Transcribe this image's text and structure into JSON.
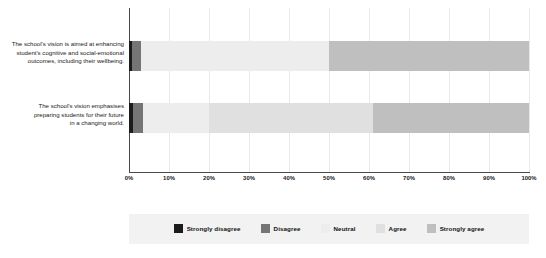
{
  "chart_data": {
    "type": "bar",
    "orientation": "horizontal",
    "stacked": true,
    "stack_mode": "percent",
    "title": "",
    "xlabel": "",
    "ylabel": "",
    "xlim": [
      0,
      100
    ],
    "grid": true,
    "legend_position": "bottom",
    "categories": [
      "The school's vision is aimed at enhancing student's cognitive and social-emotional outcomes, including their wellbeing.",
      "The school's vision emphasises preparing students for their future in a changing world."
    ],
    "category_lines": [
      [
        "The school's vision is aimed at enhancing",
        "student's cognitive and social-emotional",
        "outcomes, including their wellbeing."
      ],
      [
        "The school's vision emphasises",
        "preparing students for their future",
        "in a changing world."
      ]
    ],
    "tick_labels": [
      "0%",
      "10%",
      "20%",
      "30%",
      "40%",
      "50%",
      "60%",
      "70%",
      "80%",
      "90%",
      "100%"
    ],
    "tick_values": [
      0,
      10,
      20,
      30,
      40,
      50,
      60,
      70,
      80,
      90,
      100
    ],
    "series": [
      {
        "name": "Strongly disagree",
        "color": "#1c1c1c",
        "values": [
          0.8,
          1.0
        ]
      },
      {
        "name": "Disagree",
        "color": "#757575",
        "values": [
          2.2,
          2.5
        ]
      },
      {
        "name": "Neutral",
        "color": "#ededed",
        "values": [
          47.0,
          16.5
        ]
      },
      {
        "name": "Agree",
        "color": "#e0e0e0",
        "values": [
          0.0,
          41.0
        ]
      },
      {
        "name": "Strongly agree",
        "color": "#bfbfbf",
        "values": [
          50.0,
          39.0
        ]
      }
    ]
  },
  "legend": {
    "items": [
      {
        "label": "Strongly disagree",
        "color": "#1c1c1c"
      },
      {
        "label": "Disagree",
        "color": "#757575"
      },
      {
        "label": "Neutral",
        "color": "#ededed"
      },
      {
        "label": "Agree",
        "color": "#e0e0e0"
      },
      {
        "label": "Strongly agree",
        "color": "#bfbfbf"
      }
    ],
    "background_color": "#f2f2f2"
  },
  "style": {
    "axis_color": "#4a4a4a",
    "gridline_color": "#e9e9e9",
    "text_color": "#1a1a1a",
    "background": "#ffffff"
  }
}
